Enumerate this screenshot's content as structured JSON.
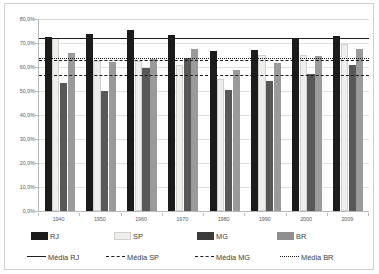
{
  "chart_data": {
    "type": "bar",
    "title": "",
    "subtitle": "",
    "xlabel": "",
    "ylabel": "",
    "ylim": [
      0,
      80
    ],
    "ytick_labels": [
      "0,0%",
      "10,0%",
      "20,0%",
      "30,0%",
      "40,0%",
      "50,0%",
      "60,0%",
      "70,0%",
      "80,0%"
    ],
    "ytick_values": [
      0,
      10,
      20,
      30,
      40,
      50,
      60,
      70,
      80
    ],
    "grid": true,
    "legend_position": "bottom",
    "categories": [
      "1940",
      "1950",
      "1960",
      "1970",
      "1980",
      "1990",
      "2000",
      "2009"
    ],
    "series": [
      {
        "name": "RJ",
        "color": "#1b1b1b",
        "values": [
          72.7,
          73.8,
          75.6,
          73.3,
          66.8,
          67.1,
          71.7,
          72.8
        ]
      },
      {
        "name": "SP",
        "color": "#eeeeec",
        "values": [
          72.0,
          62.7,
          62.6,
          61.0,
          54.8,
          64.8,
          65.0,
          69.6
        ]
      },
      {
        "name": "MG",
        "color": "#585858",
        "values": [
          53.4,
          49.8,
          59.4,
          63.6,
          50.5,
          54.1,
          57.2,
          60.9
        ]
      },
      {
        "name": "BR",
        "color": "#9a9a9a",
        "values": [
          65.8,
          62.0,
          63.2,
          67.4,
          58.7,
          61.8,
          64.7,
          67.7
        ]
      }
    ],
    "reference_lines": [
      {
        "name": "Média RJ",
        "value": 72.2,
        "style": "solid",
        "color": "#1f1f1f"
      },
      {
        "name": "Média SP",
        "value": 63.0,
        "style": "dashed",
        "color": "#1a1a1a"
      },
      {
        "name": "Média MG",
        "value": 56.5,
        "style": "dashdot",
        "color": "#1a1a1a"
      },
      {
        "name": "Média BR",
        "value": 63.9,
        "style": "dotted",
        "color": "#161616"
      }
    ]
  },
  "legend": {
    "bars": [
      {
        "label": "RJ",
        "key": "rj"
      },
      {
        "label": "SP",
        "key": "sp"
      },
      {
        "label": "MG",
        "key": "mg"
      },
      {
        "label": "BR",
        "key": "br"
      }
    ],
    "lines": [
      {
        "label": "Média RJ",
        "key": "solid"
      },
      {
        "label": "Média SP",
        "key": "dash"
      },
      {
        "label": "Média MG",
        "key": "dashdot"
      },
      {
        "label": "Média BR",
        "key": "dot"
      }
    ]
  }
}
